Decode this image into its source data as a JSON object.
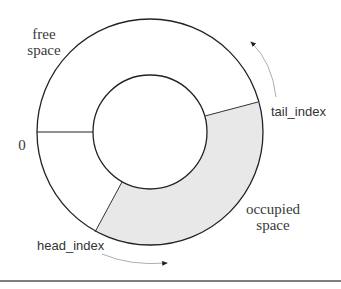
{
  "diagram": {
    "title": "",
    "labels": {
      "free_space_line1": "free",
      "free_space_line2": "space",
      "zero": "0",
      "tail_index": "tail_index",
      "head_index": "head_index",
      "occupied_line1": "occupied",
      "occupied_line2": "space"
    },
    "colors": {
      "stroke": "#222222",
      "occupied_fill": "#e8e8e8",
      "arrow": "#888888",
      "rule": "#555555"
    }
  }
}
